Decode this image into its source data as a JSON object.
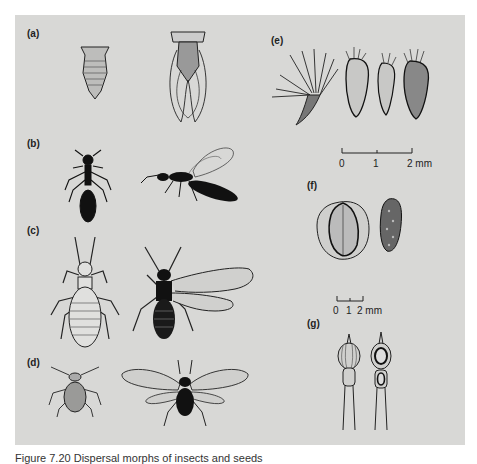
{
  "figure": {
    "panels": [
      {
        "id": "a",
        "label": "(a)"
      },
      {
        "id": "b",
        "label": "(b)"
      },
      {
        "id": "c",
        "label": "(c)"
      },
      {
        "id": "d",
        "label": "(d)"
      },
      {
        "id": "e",
        "label": "(e)"
      },
      {
        "id": "f",
        "label": "(f)"
      },
      {
        "id": "g",
        "label": "(g)"
      }
    ],
    "scale_e": {
      "ticks": [
        "0",
        "1",
        "2 mm"
      ]
    },
    "scale_f": {
      "ticks": [
        "0",
        "1",
        "2 mm"
      ]
    },
    "background_color": "#d8d8d6",
    "ink_color": "#1a1a1a"
  },
  "caption": {
    "text": "Figure 7.20 Dispersal morphs of insects and seeds"
  }
}
